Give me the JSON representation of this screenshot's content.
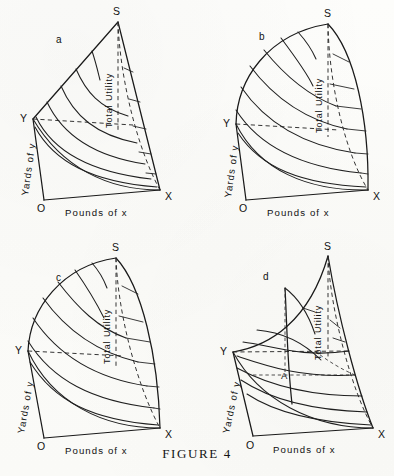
{
  "figure": {
    "caption_word": "F",
    "caption_rest": "IGURE",
    "caption_number": "4",
    "caption_full": "FIGURE 4",
    "width_px": 394,
    "height_px": 476,
    "ink_color": "#1a1a1a",
    "paper_color": "#fdfdfb"
  },
  "labels": {
    "x_axis": "Pounds of x",
    "y_axis": "Yards of y",
    "surface": "Total Utility",
    "origin": "O",
    "vertex_x": "X",
    "vertex_y": "Y",
    "vertex_s": "S",
    "point_a": "A"
  },
  "panels": [
    {
      "id": "a",
      "label": "a",
      "title": "Total Utility",
      "surface_shape": "straight-edged wedge; ridge OS rises linearly to apex S",
      "x_axis": "Pounds of x",
      "y_axis": "Yards of y",
      "contour_count": 6,
      "has_point_a": false,
      "vertices": {
        "O": "O",
        "X": "X",
        "Y": "Y",
        "S": "S"
      }
    },
    {
      "id": "b",
      "label": "b",
      "title": "Total Utility",
      "surface_shape": "convex dome; outer boundary bulges outward from Y to S",
      "x_axis": "Pounds of x",
      "y_axis": "Yards of y",
      "contour_count": 7,
      "has_point_a": false,
      "vertices": {
        "O": "O",
        "X": "X",
        "Y": "Y",
        "S": "S"
      }
    },
    {
      "id": "c",
      "label": "c",
      "title": "Total Utility",
      "surface_shape": "convex dome, narrower than b; contours sweep from Y-edge to X-edge",
      "x_axis": "Pounds of x",
      "y_axis": "Yards of y",
      "contour_count": 7,
      "has_point_a": false,
      "vertices": {
        "O": "O",
        "X": "X",
        "Y": "Y",
        "S": "S"
      }
    },
    {
      "id": "d",
      "label": "d",
      "title": "Total Utility",
      "surface_shape": "concave saddle rising steeply to S; equilibrium point A marked with dashed construction lines",
      "x_axis": "Pounds of x",
      "y_axis": "Yards of y",
      "contour_count": 7,
      "has_point_a": true,
      "point_a_label": "A",
      "vertices": {
        "O": "O",
        "X": "X",
        "Y": "Y",
        "S": "S"
      }
    }
  ]
}
